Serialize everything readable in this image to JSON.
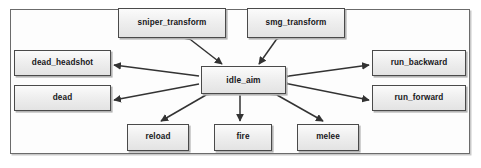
{
  "diagram": {
    "type": "state-machine",
    "canvas": {
      "width": 481,
      "height": 168
    },
    "frame": {
      "x": 10,
      "y": 9,
      "width": 460,
      "height": 145
    },
    "style": {
      "node_fill": "#efefef",
      "node_border": "#4a4a4a",
      "edge_color": "#333333",
      "frame_border": "#6b6b6b",
      "background": "#ffffff",
      "label_color": "#17171a"
    },
    "nodes": [
      {
        "id": "sniper_transform",
        "label": "sniper_transform",
        "x": 118,
        "y": 8,
        "width": 108,
        "height": 30
      },
      {
        "id": "smg_transform",
        "label": "smg_transform",
        "x": 247,
        "y": 8,
        "width": 98,
        "height": 30
      },
      {
        "id": "dead_headshot",
        "label": "dead_headshot",
        "x": 14,
        "y": 50,
        "width": 97,
        "height": 26
      },
      {
        "id": "dead",
        "label": "dead",
        "x": 14,
        "y": 85,
        "width": 97,
        "height": 26
      },
      {
        "id": "idle_aim",
        "label": "idle_aim",
        "x": 201,
        "y": 66,
        "width": 85,
        "height": 28
      },
      {
        "id": "run_backward",
        "label": "run_backward",
        "x": 372,
        "y": 50,
        "width": 94,
        "height": 26
      },
      {
        "id": "run_forward",
        "label": "run_forward",
        "x": 372,
        "y": 85,
        "width": 94,
        "height": 26
      },
      {
        "id": "reload",
        "label": "reload",
        "x": 127,
        "y": 124,
        "width": 62,
        "height": 27
      },
      {
        "id": "fire",
        "label": "fire",
        "x": 214,
        "y": 124,
        "width": 58,
        "height": 27
      },
      {
        "id": "melee",
        "label": "melee",
        "x": 297,
        "y": 124,
        "width": 62,
        "height": 27
      }
    ],
    "edges": [
      {
        "from": "sniper_transform",
        "to": "idle_aim",
        "direction": "bidirectional",
        "x1": 191,
        "y1": 40,
        "x2": 222,
        "y2": 64
      },
      {
        "from": "smg_transform",
        "to": "idle_aim",
        "direction": "bidirectional",
        "x1": 276,
        "y1": 40,
        "x2": 259,
        "y2": 64
      },
      {
        "from": "idle_aim",
        "to": "dead_headshot",
        "direction": "unidirectional",
        "x1": 199,
        "y1": 76,
        "x2": 114,
        "y2": 65
      },
      {
        "from": "idle_aim",
        "to": "dead",
        "direction": "unidirectional",
        "x1": 199,
        "y1": 84,
        "x2": 114,
        "y2": 100
      },
      {
        "from": "idle_aim",
        "to": "run_backward",
        "direction": "bidirectional",
        "x1": 289,
        "y1": 76,
        "x2": 369,
        "y2": 65
      },
      {
        "from": "idle_aim",
        "to": "run_forward",
        "direction": "bidirectional",
        "x1": 289,
        "y1": 84,
        "x2": 369,
        "y2": 100
      },
      {
        "from": "idle_aim",
        "to": "reload",
        "direction": "bidirectional",
        "x1": 206,
        "y1": 95,
        "x2": 161,
        "y2": 121
      },
      {
        "from": "idle_aim",
        "to": "fire",
        "direction": "bidirectional",
        "x1": 240,
        "y1": 96,
        "x2": 240,
        "y2": 121
      },
      {
        "from": "idle_aim",
        "to": "melee",
        "direction": "bidirectional",
        "x1": 277,
        "y1": 95,
        "x2": 323,
        "y2": 121
      }
    ]
  }
}
